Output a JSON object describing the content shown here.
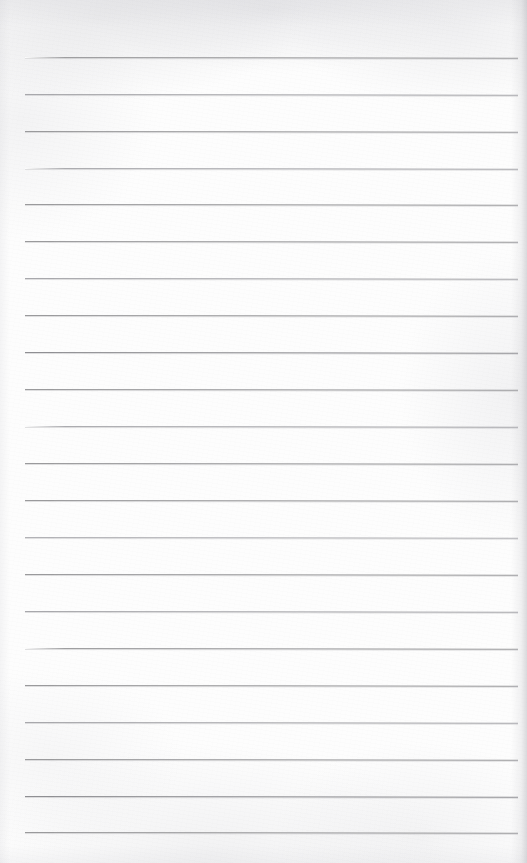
{
  "document": {
    "kind": "scanned-lined-notepad-page",
    "title": "Blank Lined Notepad Page",
    "description": "Scanned blank ruled writing paper with horizontal rules and no handwritten content",
    "page_width_px": 527,
    "page_height_px": 863,
    "content_text": "",
    "has_handwriting": false,
    "has_printed_text": false
  },
  "colors": {
    "paper": "#fdfdfd",
    "rule_line": "#9a9a9c",
    "rule_line_light": "#b2b2b6",
    "rule_line_dark": "#8f8f93",
    "edge_shadow": "#b0b0b6"
  },
  "ruling": {
    "count": 22,
    "spacing_px": 36.9,
    "first_line_y_px": 57,
    "last_line_y_px": 832,
    "left_margin_px": 25,
    "right_edge_px": 518,
    "line_thickness_px": 1,
    "skew_deg": 0.085,
    "lines": [
      {
        "index": 1,
        "y": 57,
        "x1": 25,
        "x2": 518,
        "weight": "normal"
      },
      {
        "index": 2,
        "y": 94,
        "x1": 25,
        "x2": 518,
        "weight": "light"
      },
      {
        "index": 3,
        "y": 131,
        "x1": 25,
        "x2": 518,
        "weight": "normal"
      },
      {
        "index": 4,
        "y": 168,
        "x1": 25,
        "x2": 518,
        "weight": "light"
      },
      {
        "index": 5,
        "y": 204,
        "x1": 25,
        "x2": 518,
        "weight": "normal"
      },
      {
        "index": 6,
        "y": 241,
        "x1": 25,
        "x2": 518,
        "weight": "normal"
      },
      {
        "index": 7,
        "y": 278,
        "x1": 25,
        "x2": 518,
        "weight": "light"
      },
      {
        "index": 8,
        "y": 315,
        "x1": 25,
        "x2": 518,
        "weight": "normal"
      },
      {
        "index": 9,
        "y": 352,
        "x1": 25,
        "x2": 518,
        "weight": "dark"
      },
      {
        "index": 10,
        "y": 389,
        "x1": 25,
        "x2": 518,
        "weight": "normal"
      },
      {
        "index": 11,
        "y": 426,
        "x1": 25,
        "x2": 518,
        "weight": "light"
      },
      {
        "index": 12,
        "y": 463,
        "x1": 25,
        "x2": 518,
        "weight": "normal"
      },
      {
        "index": 13,
        "y": 500,
        "x1": 25,
        "x2": 518,
        "weight": "normal"
      },
      {
        "index": 14,
        "y": 537,
        "x1": 25,
        "x2": 518,
        "weight": "lighter"
      },
      {
        "index": 15,
        "y": 574,
        "x1": 25,
        "x2": 518,
        "weight": "normal"
      },
      {
        "index": 16,
        "y": 611,
        "x1": 25,
        "x2": 518,
        "weight": "light"
      },
      {
        "index": 17,
        "y": 648,
        "x1": 25,
        "x2": 518,
        "weight": "normal"
      },
      {
        "index": 18,
        "y": 685,
        "x1": 25,
        "x2": 518,
        "weight": "normal"
      },
      {
        "index": 19,
        "y": 722,
        "x1": 25,
        "x2": 518,
        "weight": "light"
      },
      {
        "index": 20,
        "y": 759,
        "x1": 25,
        "x2": 518,
        "weight": "normal"
      },
      {
        "index": 21,
        "y": 796,
        "x1": 25,
        "x2": 518,
        "weight": "dark"
      },
      {
        "index": 22,
        "y": 832,
        "x1": 25,
        "x2": 518,
        "weight": "normal"
      }
    ]
  }
}
